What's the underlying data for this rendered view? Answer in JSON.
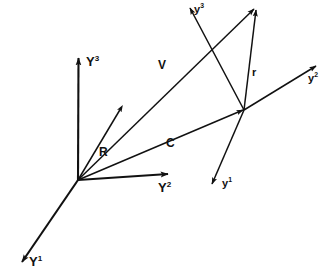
{
  "figure": {
    "kind": "vector-diagram",
    "background_color": "#ffffff",
    "stroke_color": "#111111",
    "width": 328,
    "height": 273
  },
  "frames": {
    "global": {
      "name": "global-frame",
      "origin_label": "",
      "axes": [
        {
          "key": "Y1",
          "base": "Y",
          "exponent": "1",
          "text": "Y1"
        },
        {
          "key": "Y2",
          "base": "Y",
          "exponent": "2",
          "text": "Y2"
        },
        {
          "key": "Y3",
          "base": "Y",
          "exponent": "3",
          "text": "Y3"
        }
      ]
    },
    "local": {
      "name": "local-frame",
      "origin_label": "",
      "axes": [
        {
          "key": "y1",
          "base": "y",
          "exponent": "1",
          "text": "y1"
        },
        {
          "key": "y2",
          "base": "y",
          "exponent": "2",
          "text": "y2"
        },
        {
          "key": "y3",
          "base": "y",
          "exponent": "3",
          "text": "y3"
        }
      ]
    }
  },
  "vectors": [
    {
      "key": "R",
      "label": "R",
      "from": "global-origin",
      "to": "mid-point"
    },
    {
      "key": "C",
      "label": "C",
      "from": "global-origin",
      "to": "local-origin"
    },
    {
      "key": "V",
      "label": "V",
      "from": "global-origin",
      "to": "tip-point"
    },
    {
      "key": "r",
      "label": "r",
      "from": "local-origin",
      "to": "tip-point"
    }
  ],
  "labels": {
    "Y1": {
      "base": "Y",
      "exp": "1"
    },
    "Y2": {
      "base": "Y",
      "exp": "2"
    },
    "Y3": {
      "base": "Y",
      "exp": "3"
    },
    "y1": {
      "base": "y",
      "exp": "1"
    },
    "y2": {
      "base": "y",
      "exp": "2"
    },
    "y3": {
      "base": "y",
      "exp": "3"
    },
    "R": "R",
    "C": "C",
    "V": "V",
    "r": "r"
  }
}
